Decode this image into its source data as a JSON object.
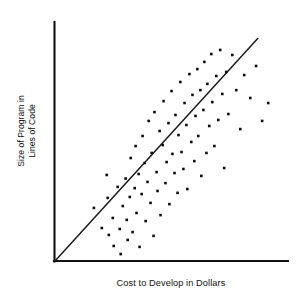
{
  "chart_data": {
    "type": "scatter",
    "title": "",
    "subtitle": "",
    "xlabel": "Cost to Develop in Dollars",
    "ylabel_line1": "Size of Program in",
    "ylabel_line2": "Lines of Code",
    "ylabel": "Size of Program in Lines of Code",
    "grid": false,
    "legend": false,
    "legend_position": "none",
    "xticks": [],
    "yticks": [],
    "xtick_labels": [],
    "ytick_labels": [],
    "xlim": [
      0,
      100
    ],
    "ylim": [
      0,
      100
    ],
    "axis_color": "#111111",
    "point_color": "#0d0d0d",
    "trend_color": "#1a1a1a",
    "marker": "square",
    "marker_size_px": 2.6,
    "annotations": [],
    "trend_series": {
      "name": "Regression line",
      "x": [
        0,
        87.2
      ],
      "y": [
        0,
        93.3
      ]
    },
    "series": [
      {
        "name": "Programs",
        "points": [
          [
            16.7,
            22.2
          ],
          [
            20.1,
            13.8
          ],
          [
            22.2,
            36.0
          ],
          [
            22.6,
            26.4
          ],
          [
            23.1,
            10.9
          ],
          [
            24.8,
            18.0
          ],
          [
            25.2,
            6.3
          ],
          [
            26.9,
            31.0
          ],
          [
            27.8,
            13.4
          ],
          [
            28.2,
            2.9
          ],
          [
            29.1,
            23.0
          ],
          [
            30.3,
            34.5
          ],
          [
            30.8,
            17.2
          ],
          [
            31.2,
            8.8
          ],
          [
            32.1,
            26.8
          ],
          [
            32.5,
            43.1
          ],
          [
            33.3,
            12.1
          ],
          [
            34.2,
            30.5
          ],
          [
            34.6,
            48.1
          ],
          [
            35.0,
            20.1
          ],
          [
            35.9,
            36.4
          ],
          [
            36.3,
            5.9
          ],
          [
            37.2,
            28.0
          ],
          [
            37.6,
            52.3
          ],
          [
            38.5,
            41.0
          ],
          [
            38.9,
            16.7
          ],
          [
            39.7,
            33.1
          ],
          [
            40.2,
            58.6
          ],
          [
            41.0,
            24.3
          ],
          [
            41.5,
            45.2
          ],
          [
            42.3,
            10.5
          ],
          [
            42.7,
            62.3
          ],
          [
            43.6,
            37.2
          ],
          [
            44.0,
            29.3
          ],
          [
            44.9,
            54.4
          ],
          [
            45.3,
            19.2
          ],
          [
            46.2,
            48.5
          ],
          [
            46.6,
            66.9
          ],
          [
            47.4,
            32.6
          ],
          [
            47.9,
            41.4
          ],
          [
            48.7,
            57.7
          ],
          [
            49.1,
            23.8
          ],
          [
            50.0,
            71.1
          ],
          [
            50.4,
            44.8
          ],
          [
            51.3,
            36.8
          ],
          [
            51.7,
            61.1
          ],
          [
            52.6,
            28.5
          ],
          [
            53.0,
            52.7
          ],
          [
            53.8,
            74.9
          ],
          [
            54.3,
            45.6
          ],
          [
            55.1,
            38.5
          ],
          [
            55.6,
            66.1
          ],
          [
            56.4,
            56.9
          ],
          [
            56.8,
            30.1
          ],
          [
            57.7,
            78.2
          ],
          [
            58.5,
            49.8
          ],
          [
            59.0,
            69.5
          ],
          [
            59.8,
            41.8
          ],
          [
            60.3,
            60.7
          ],
          [
            61.1,
            80.3
          ],
          [
            61.5,
            52.3
          ],
          [
            62.4,
            71.5
          ],
          [
            62.8,
            35.6
          ],
          [
            63.7,
            63.2
          ],
          [
            64.1,
            83.3
          ],
          [
            65.0,
            45.2
          ],
          [
            65.4,
            74.1
          ],
          [
            66.2,
            56.5
          ],
          [
            67.1,
            86.6
          ],
          [
            67.5,
            66.5
          ],
          [
            68.4,
            48.1
          ],
          [
            69.2,
            77.4
          ],
          [
            70.1,
            59.0
          ],
          [
            70.9,
            88.3
          ],
          [
            71.8,
            69.9
          ],
          [
            72.6,
            38.9
          ],
          [
            73.5,
            79.1
          ],
          [
            74.4,
            61.5
          ],
          [
            76.1,
            86.2
          ],
          [
            77.8,
            71.5
          ],
          [
            79.5,
            55.2
          ],
          [
            81.2,
            77.8
          ],
          [
            83.8,
            68.2
          ],
          [
            86.3,
            81.6
          ],
          [
            88.9,
            58.6
          ],
          [
            91.5,
            66.1
          ]
        ]
      }
    ]
  }
}
